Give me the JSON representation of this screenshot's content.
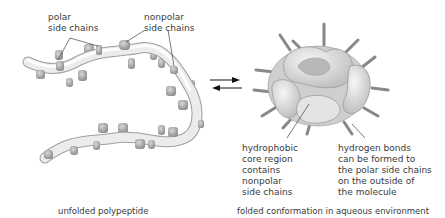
{
  "labels": {
    "polar": "polar\nside chains",
    "nonpolar": "nonpolar\nside chains",
    "core": "hydrophobic\ncore region\ncontains\nnonpolar\nside chains",
    "hbonds": "hydrogen bonds\ncan be formed to\nthe polar side chains\non the outside of\nthe molecule"
  },
  "captions": {
    "left": "unfolded polypeptide",
    "right": "folded conformation in aqueous environment"
  },
  "arrows": {
    "type": "equilibrium",
    "forward": "right",
    "reverse": "left"
  },
  "colors": {
    "chain": "#e6e6e6",
    "chain_outline": "#a8a8a8",
    "side_chain": "#9a9a9a",
    "text": "#3a3a3a"
  }
}
